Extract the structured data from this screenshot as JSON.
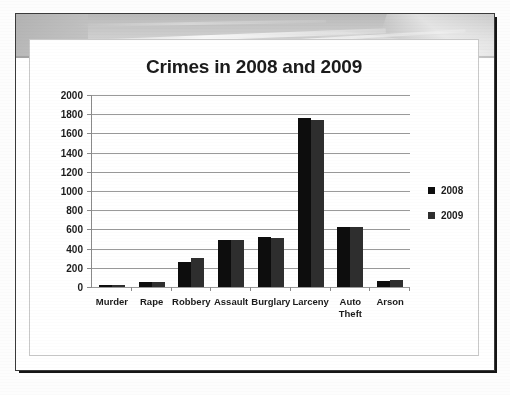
{
  "slide": {
    "banner_name": "slide-design-banner"
  },
  "chart": {
    "title": "Crimes in 2008 and 2009"
  },
  "legend": {
    "entries": [
      {
        "label": "2008",
        "color": "#0d0d0d"
      },
      {
        "label": "2009",
        "color": "#2e2e2e"
      }
    ]
  },
  "chart_data": {
    "type": "bar",
    "title": "Crimes in 2008 and 2009",
    "xlabel": "",
    "ylabel": "",
    "ylim": [
      0,
      2000
    ],
    "ytick_step": 200,
    "yticks": [
      2000,
      1800,
      1600,
      1400,
      1200,
      1000,
      800,
      600,
      400,
      200,
      0
    ],
    "ytick_labels": [
      "2000",
      "1800",
      "1600",
      "1400",
      "1200",
      "1000",
      "800",
      "600",
      "400",
      "200",
      "0"
    ],
    "categories": [
      "Murder",
      "Rape",
      "Robbery",
      "Assault",
      "Burglary",
      "Larceny",
      "Auto Theft",
      "Arson"
    ],
    "category_labels": [
      [
        "Murder"
      ],
      [
        "Rape"
      ],
      [
        "Robbery"
      ],
      [
        "Assault"
      ],
      [
        "Burglary"
      ],
      [
        "Larceny"
      ],
      [
        "Auto",
        "Theft"
      ],
      [
        "Arson"
      ]
    ],
    "series": [
      {
        "name": "2008",
        "color": "#0d0d0d",
        "values": [
          20,
          55,
          265,
          485,
          520,
          1760,
          625,
          60
        ]
      },
      {
        "name": "2009",
        "color": "#2e2e2e",
        "values": [
          20,
          55,
          300,
          485,
          515,
          1740,
          625,
          70
        ]
      }
    ],
    "grid": true,
    "grid_axis": "y",
    "legend_position": "right"
  }
}
